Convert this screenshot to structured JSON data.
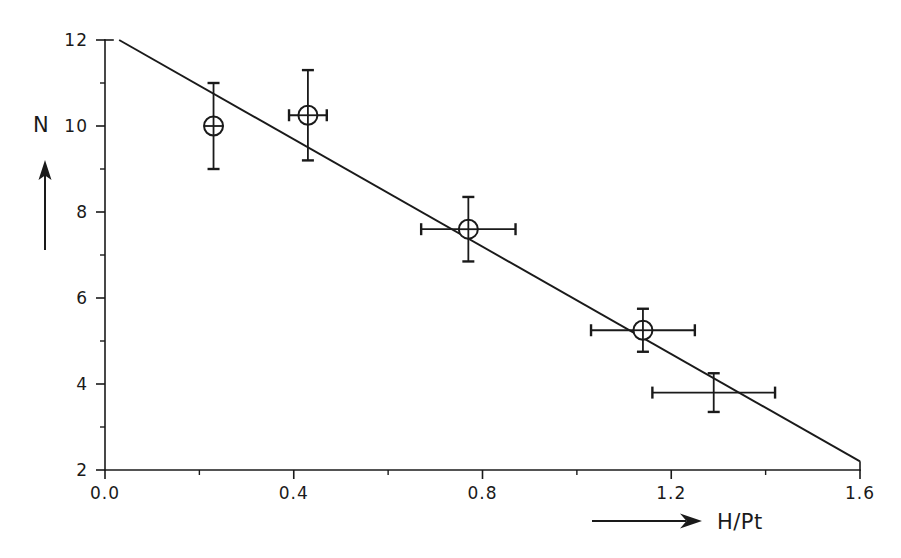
{
  "chart_data": {
    "type": "scatter",
    "title": "",
    "subtitle": "",
    "xlabel": "H/Pt",
    "ylabel": "N",
    "xlim": [
      0.0,
      1.6
    ],
    "ylim": [
      2,
      12
    ],
    "grid": false,
    "legend": "none",
    "xticks": [
      "0.0",
      "0.4",
      "0.8",
      "1.2",
      "1.6"
    ],
    "xtick_values": [
      0.0,
      0.4,
      0.8,
      1.2,
      1.6
    ],
    "xminor_values": [
      0.2,
      0.6,
      1.0,
      1.4
    ],
    "yticks": [
      "2",
      "4",
      "6",
      "8",
      "10",
      "12"
    ],
    "ytick_values": [
      2,
      4,
      6,
      8,
      10,
      12
    ],
    "yminor_values": [
      3,
      5,
      7,
      9,
      11
    ],
    "points": [
      {
        "label": "point-1",
        "x": 0.23,
        "y": 10.0,
        "xerr": 0.0,
        "yerr": 1.0,
        "marker": "circle-with-cross"
      },
      {
        "label": "point-2",
        "x": 0.43,
        "y": 10.25,
        "xerr": 0.04,
        "yerr": 1.05,
        "marker": "circle-with-cross"
      },
      {
        "label": "point-3",
        "x": 0.77,
        "y": 7.6,
        "xerr": 0.1,
        "yerr": 0.75,
        "marker": "circle-with-cross"
      },
      {
        "label": "point-4",
        "x": 1.14,
        "y": 5.25,
        "xerr": 0.11,
        "yerr": 0.5,
        "marker": "circle-with-cross"
      },
      {
        "label": "point-5",
        "x": 1.29,
        "y": 3.8,
        "xerr": 0.13,
        "yerr": 0.45,
        "marker": "cross"
      }
    ],
    "fit_line": {
      "label": "linear-fit",
      "x_start": 0.03,
      "y_start": 12.0,
      "x_end": 1.6,
      "y_end": 2.2,
      "slope": -6.24,
      "intercept": 12.19
    },
    "annotations": {
      "y_axis_arrow": "upward arrow beneath N label",
      "x_axis_arrow": "rightward arrow before H/Pt label"
    }
  }
}
